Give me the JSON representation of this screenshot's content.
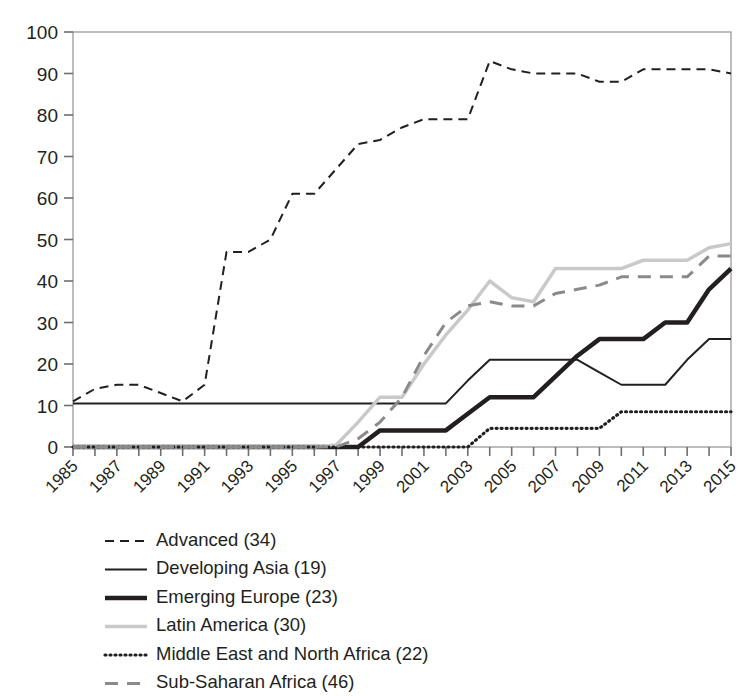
{
  "chart_data": {
    "type": "line",
    "title": "",
    "subtitle": "",
    "xlabel": "",
    "ylabel": "",
    "xlim": [
      1985,
      2015
    ],
    "ylim": [
      0,
      100
    ],
    "grid": false,
    "legend_position": "below",
    "x": [
      1985,
      1986,
      1987,
      1988,
      1989,
      1990,
      1991,
      1992,
      1993,
      1994,
      1995,
      1996,
      1997,
      1998,
      1999,
      2000,
      2001,
      2002,
      2003,
      2004,
      2005,
      2006,
      2007,
      2008,
      2009,
      2010,
      2011,
      2012,
      2013,
      2014,
      2015
    ],
    "x_tick_labels": [
      "1985",
      "1987",
      "1989",
      "1991",
      "1993",
      "1995",
      "1997",
      "1999",
      "2001",
      "2003",
      "2005",
      "2007",
      "2009",
      "2011",
      "2013",
      "2015"
    ],
    "y_tick_labels": [
      "0",
      "10",
      "20",
      "30",
      "40",
      "50",
      "60",
      "70",
      "80",
      "90",
      "100"
    ],
    "y_ticks": [
      0,
      10,
      20,
      30,
      40,
      50,
      60,
      70,
      80,
      90,
      100
    ],
    "series": [
      {
        "name": "Advanced (34)",
        "label": "Advanced (34)",
        "count": 34,
        "style": "dashed",
        "color": "#231f20",
        "width": 2,
        "dash": "9,6",
        "values": [
          11,
          14,
          15,
          15,
          13,
          11,
          15,
          47,
          47,
          50,
          61,
          61,
          67,
          73,
          74,
          77,
          79,
          79,
          79,
          93,
          91,
          90,
          90,
          90,
          88,
          88,
          91,
          91,
          91,
          91,
          90
        ]
      },
      {
        "name": "Developing Asia (19)",
        "label": "Developing Asia (19)",
        "count": 19,
        "style": "solid-thin",
        "color": "#231f20",
        "width": 2,
        "dash": "",
        "values": [
          10.5,
          10.5,
          10.5,
          10.5,
          10.5,
          10.5,
          10.5,
          10.5,
          10.5,
          10.5,
          10.5,
          10.5,
          10.5,
          10.5,
          10.5,
          10.5,
          10.5,
          10.5,
          16,
          21,
          21,
          21,
          21,
          21,
          18,
          15,
          15,
          15,
          21,
          26,
          26
        ]
      },
      {
        "name": "Emerging Europe (23)",
        "label": "Emerging Europe (23)",
        "count": 23,
        "style": "solid-thick",
        "color": "#231f20",
        "width": 4.5,
        "dash": "",
        "values": [
          0,
          0,
          0,
          0,
          0,
          0,
          0,
          0,
          0,
          0,
          0,
          0,
          0,
          0,
          4,
          4,
          4,
          4,
          8,
          12,
          12,
          12,
          17,
          22,
          26,
          26,
          26,
          30,
          30,
          38,
          43
        ]
      },
      {
        "name": "Latin America (30)",
        "label": "Latin America (30)",
        "count": 30,
        "style": "solid-light",
        "color": "#c9c9c9",
        "width": 3.5,
        "dash": "",
        "values": [
          0,
          0,
          0,
          0,
          0,
          0,
          0,
          0,
          0,
          0,
          0,
          0,
          0.5,
          6,
          12,
          12,
          20,
          27,
          33,
          40,
          36,
          35,
          43,
          43,
          43,
          43,
          45,
          45,
          45,
          48,
          49
        ]
      },
      {
        "name": "Middle East and North Africa (22)",
        "label": "Middle East and North Africa (22)",
        "count": 22,
        "style": "dotted",
        "color": "#231f20",
        "width": 3.2,
        "dash": "1,4",
        "values": [
          0,
          0,
          0,
          0,
          0,
          0,
          0,
          0,
          0,
          0,
          0,
          0,
          0,
          0,
          0,
          0,
          0,
          0,
          0,
          4.5,
          4.5,
          4.5,
          4.5,
          4.5,
          4.5,
          8.5,
          8.5,
          8.5,
          8.5,
          8.5,
          8.5
        ]
      },
      {
        "name": "Sub-Saharan Africa (46)",
        "label": "Sub-Saharan Africa (46)",
        "count": 46,
        "style": "dashed-gray",
        "color": "#8a8a8a",
        "width": 3,
        "dash": "13,9",
        "values": [
          0,
          0,
          0,
          0,
          0,
          0,
          0,
          0,
          0,
          0,
          0,
          0,
          0,
          2,
          6,
          12,
          22,
          30,
          34,
          35,
          34,
          34,
          37,
          38,
          39,
          41,
          41,
          41,
          41,
          46,
          46
        ]
      }
    ]
  }
}
